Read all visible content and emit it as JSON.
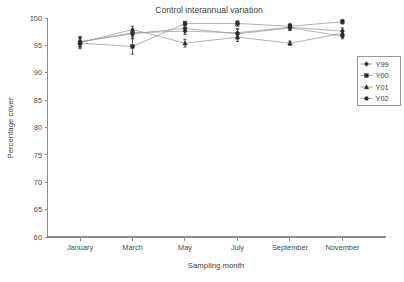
{
  "chart_data": {
    "type": "line",
    "title": "Control interannual variation",
    "xlabel": "Sampling month",
    "ylabel": "Percentage cover",
    "categories": [
      "January",
      "March",
      "May",
      "July",
      "September",
      "November"
    ],
    "xtick_labels": [
      "January",
      "March",
      "May",
      "July",
      "September",
      "November"
    ],
    "ytick_labels": [
      "60",
      "65",
      "70",
      "75",
      "80",
      "85",
      "90",
      "95",
      "100"
    ],
    "ytick_values": [
      60,
      65,
      70,
      75,
      80,
      85,
      90,
      95,
      100
    ],
    "ylim": [
      60,
      100
    ],
    "grid": false,
    "legend_position": "right",
    "error_bars": true,
    "series": [
      {
        "name": "Y99",
        "marker": "diamond",
        "values": [
          95.6,
          97.3,
          97.6,
          97.3,
          98.3,
          97.6
        ],
        "errors": [
          0.9,
          0.7,
          0.6,
          0.7,
          0.5,
          0.6
        ]
      },
      {
        "name": "Y00",
        "marker": "square",
        "values": [
          95.4,
          94.8,
          99.0,
          99.0,
          98.5,
          99.3
        ],
        "errors": [
          1.0,
          1.4,
          0.4,
          0.5,
          0.5,
          0.4
        ]
      },
      {
        "name": "Y01",
        "marker": "triangle",
        "values": [
          95.5,
          97.9,
          95.4,
          96.5,
          95.4,
          97.2
        ],
        "errors": [
          0.8,
          0.6,
          0.7,
          0.8,
          0.4,
          0.6
        ]
      },
      {
        "name": "Y02",
        "marker": "circle",
        "values": [
          95.7,
          97.1,
          98.1,
          97.1,
          98.2,
          96.7
        ],
        "errors": [
          0.9,
          0.8,
          0.6,
          0.9,
          0.5,
          0.5
        ]
      }
    ]
  },
  "colors": {
    "line": "#9a9a9a",
    "marker": "#2b2b2b",
    "axis": "#8c8c8c",
    "text": "#3d3d3d",
    "background": "#ffffff"
  }
}
